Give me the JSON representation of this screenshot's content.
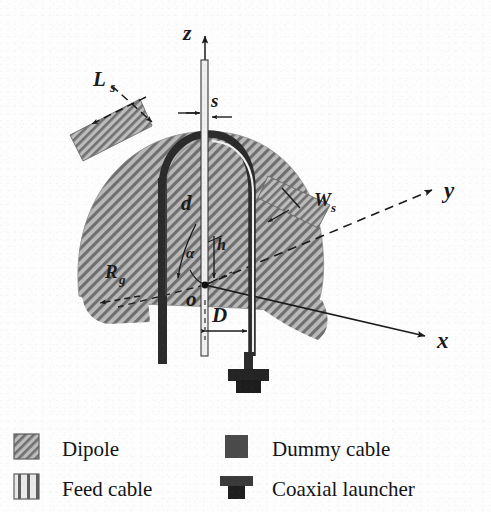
{
  "figure": {
    "type": "technical-diagram",
    "axes": [
      {
        "id": "z",
        "label": "z",
        "orientation": "vertical-up",
        "style": "solid-arrow"
      },
      {
        "id": "y",
        "label": "y",
        "orientation": "upper-right-dashed",
        "style": "dashed-arrow"
      },
      {
        "id": "x",
        "label": "x",
        "orientation": "lower-right",
        "style": "solid-arrow"
      }
    ],
    "origin_label": "o",
    "dimensions": [
      {
        "id": "Ls",
        "base": "L",
        "sub": "s",
        "description": "stub length, upper-left hatched stub"
      },
      {
        "id": "Ws",
        "base": "W",
        "sub": "s",
        "description": "stub width, right hatched stub"
      },
      {
        "id": "s",
        "base": "s",
        "sub": "",
        "description": "gap at top near z-axis"
      },
      {
        "id": "d",
        "base": "d",
        "sub": "",
        "description": "loop cable separation"
      },
      {
        "id": "D",
        "base": "D",
        "sub": "",
        "description": "offset from origin along x"
      },
      {
        "id": "Rg",
        "base": "R",
        "sub": "g",
        "description": "ground disc radius, lower-left"
      },
      {
        "id": "h",
        "base": "h",
        "sub": "",
        "description": "height above origin"
      },
      {
        "id": "alpha",
        "base": "α",
        "sub": "",
        "description": "angle at origin"
      }
    ]
  },
  "legend": {
    "items": [
      {
        "id": "dipole",
        "label": "Dipole",
        "swatch": "hatched-square",
        "column": 1,
        "row": 1
      },
      {
        "id": "feed-cable",
        "label": "Feed cable",
        "swatch": "striped-square",
        "column": 1,
        "row": 2
      },
      {
        "id": "dummy-cable",
        "label": "Dummy cable",
        "swatch": "solid-square",
        "column": 2,
        "row": 1
      },
      {
        "id": "coaxial-launcher",
        "label": "Coaxial launcher",
        "swatch": "tee-connector",
        "column": 2,
        "row": 2
      }
    ]
  },
  "colors": {
    "background": "#fdfdfd",
    "ink": "#1a1a1a",
    "hatch_fill": "#b9b9b9",
    "hatch_line": "#6e6e6e",
    "cable_dark": "#2a2a2a",
    "cable_light": "#efefef",
    "legend_solid": "#4a4a4a"
  }
}
